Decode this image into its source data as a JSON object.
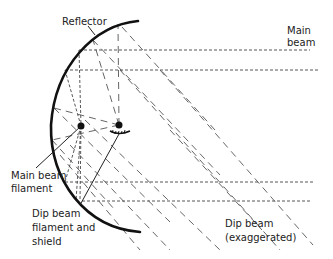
{
  "diagram": {
    "labels": {
      "reflector": "Reflector",
      "main_beam_line1": "Main",
      "main_beam_line2": "beam",
      "main_filament_line1": "Main beam",
      "main_filament_line2": "filament",
      "dip_filament_line1": "Dip beam",
      "dip_filament_line2": "filament and",
      "dip_filament_line3": "shield",
      "dip_beam_line1": "Dip beam",
      "dip_beam_line2": "(exaggerated)"
    },
    "colors": {
      "ink": "#222222",
      "reflector": "#111111",
      "dotted": "#444444",
      "dashed": "#555555"
    }
  }
}
